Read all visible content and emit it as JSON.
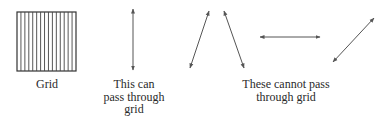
{
  "diagram": {
    "stroke_color": "#555555",
    "grid": {
      "label": "Grid",
      "box": {
        "x": 17,
        "y": 12,
        "width": 59,
        "height": 59
      },
      "line_count": 14
    },
    "passing_arrows": {
      "label_lines": [
        "This can",
        "pass through",
        "grid"
      ],
      "arrows": [
        {
          "name": "vertical",
          "x1": 133,
          "y1": 9,
          "x2": 133,
          "y2": 70
        }
      ]
    },
    "blocked_arrows": {
      "label_lines": [
        "These cannot pass",
        "through grid"
      ],
      "arrows": [
        {
          "name": "diagonal-left-a",
          "x1": 190,
          "y1": 68,
          "x2": 209,
          "y2": 11
        },
        {
          "name": "diagonal-right",
          "x1": 224,
          "y1": 11,
          "x2": 244,
          "y2": 68
        },
        {
          "name": "horizontal",
          "x1": 260,
          "y1": 37,
          "x2": 320,
          "y2": 37
        },
        {
          "name": "diagonal-up",
          "x1": 333,
          "y1": 62,
          "x2": 374,
          "y2": 18
        }
      ]
    }
  }
}
